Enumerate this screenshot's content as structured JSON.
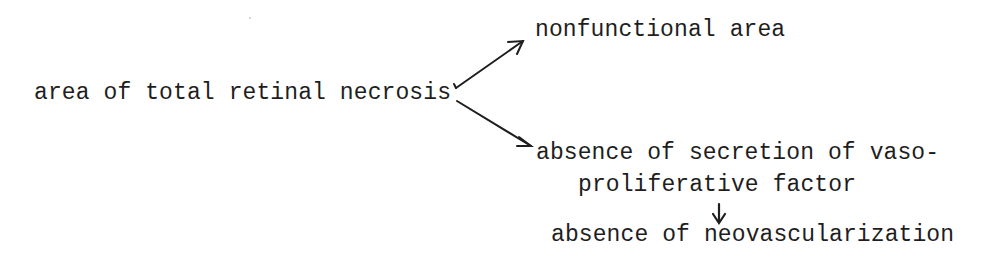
{
  "diagram": {
    "type": "flow",
    "nodes": {
      "source": "area of total retinal necrosis",
      "branch_top": "nonfunctional area",
      "branch_bottom_line1": "absence of secretion of vaso-",
      "branch_bottom_line2": "proliferative factor",
      "result": "absence of neovascularization"
    },
    "edges": [
      {
        "from": "area of total retinal necrosis",
        "to": "nonfunctional area"
      },
      {
        "from": "area of total retinal necrosis",
        "to": "absence of secretion of vaso-proliferative factor"
      },
      {
        "from": "absence of secretion of vaso-proliferative factor",
        "to": "absence of neovascularization"
      }
    ],
    "colors": {
      "ink": "#1e1e1e",
      "background": "#ffffff"
    }
  }
}
